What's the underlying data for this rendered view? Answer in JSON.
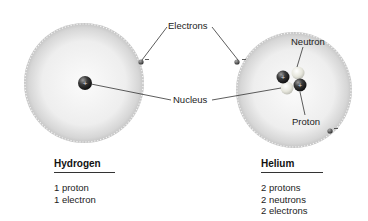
{
  "labels": {
    "electrons": "Electrons",
    "nucleus": "Nucleus",
    "neutron": "Neutron",
    "proton": "Proton",
    "plus_sign": "+",
    "minus_sign": "−"
  },
  "atoms": [
    {
      "name": "Hydrogen",
      "facts": [
        "1 proton",
        "1 electron"
      ]
    },
    {
      "name": "Helium",
      "facts": [
        "2 protons",
        "2 neutrons",
        "2 electrons"
      ]
    }
  ],
  "colors": {
    "cloud_edge": "#c8c8c8",
    "cloud_center": "#f4f4f4",
    "proton": "#2a2a2a",
    "neutron": "#e8e8e0",
    "leader_line": "#333333"
  }
}
